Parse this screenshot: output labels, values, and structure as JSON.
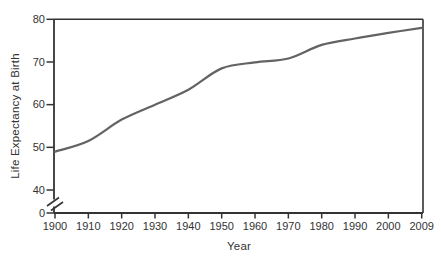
{
  "chart_data": {
    "type": "line",
    "title": "",
    "xlabel": "Year",
    "ylabel": "Life Expectancy at Birth",
    "categories": [
      "1900",
      "1910",
      "1920",
      "1930",
      "1940",
      "1950",
      "1960",
      "1970",
      "1980",
      "1990",
      "2000",
      "2009"
    ],
    "series": [
      {
        "name": "life-expectancy-at-birth",
        "values": [
          49,
          51.5,
          56.5,
          60,
          63.5,
          68.5,
          69.9,
          70.8,
          74,
          75.5,
          76.8,
          78
        ]
      }
    ],
    "y_ticks_main": [
      40,
      50,
      60,
      70,
      80
    ],
    "y_tick_zero_label": "0",
    "y_axis_break": true,
    "ylim": [
      40,
      80
    ],
    "grid": false,
    "legend_position": "none",
    "plot_box": true,
    "colors": {
      "line": "#636363",
      "axis": "#333333",
      "text": "#333333",
      "background": "#ffffff"
    }
  }
}
